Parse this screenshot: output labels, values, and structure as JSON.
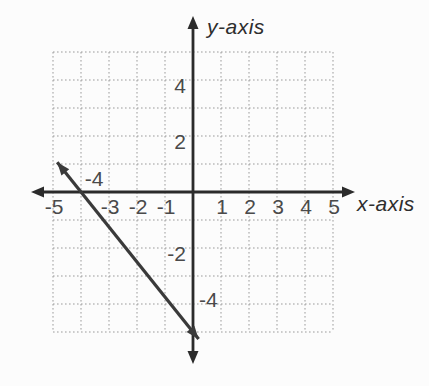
{
  "figure": {
    "background": "#fcfcfc",
    "axis_color": "#2b2b2b",
    "grid_color": "#9b9b9b",
    "line_color": "#3a3a3a",
    "tick_color": "#4a4a4a"
  },
  "chart_data": {
    "type": "line",
    "title": "",
    "xlabel": "x-axis",
    "ylabel": "y-axis",
    "xlim": [
      -5,
      5
    ],
    "ylim": [
      -5,
      5
    ],
    "grid": true,
    "grid_style": "dotted",
    "x_ticks": [
      {
        "label": "-5",
        "value": -5,
        "placement": "below"
      },
      {
        "label": "-4",
        "value": -4,
        "placement": "above"
      },
      {
        "label": "-3",
        "value": -3,
        "placement": "below"
      },
      {
        "label": "-2",
        "value": -2,
        "placement": "below"
      },
      {
        "label": "-1",
        "value": -1,
        "placement": "below"
      },
      {
        "label": "1",
        "value": 1,
        "placement": "below"
      },
      {
        "label": "2",
        "value": 2,
        "placement": "below"
      },
      {
        "label": "3",
        "value": 3,
        "placement": "below"
      },
      {
        "label": "4",
        "value": 4,
        "placement": "below"
      },
      {
        "label": "5",
        "value": 5,
        "placement": "below"
      }
    ],
    "y_ticks": [
      {
        "label": "4",
        "value": 4,
        "placement": "left"
      },
      {
        "label": "2",
        "value": 2,
        "placement": "left"
      },
      {
        "label": "-2",
        "value": -2,
        "placement": "left"
      },
      {
        "label": "-4",
        "value": -4,
        "placement": "right"
      }
    ],
    "series": [
      {
        "name": "graphed-line",
        "slope": -1.25,
        "y_intercept": -5,
        "points_on_line": [
          [
            -4,
            0
          ],
          [
            0,
            -5
          ]
        ],
        "draw_range_x": [
          -4.85,
          0.2
        ],
        "arrows": "both"
      }
    ]
  }
}
